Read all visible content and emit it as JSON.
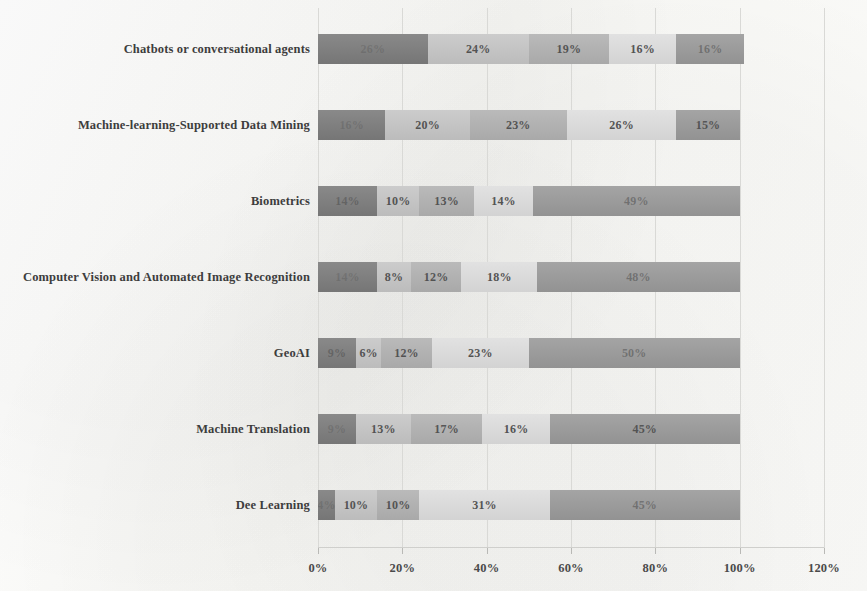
{
  "chart_data": {
    "type": "bar",
    "orientation": "horizontal",
    "stacked": true,
    "title": "",
    "xlabel": "",
    "ylabel": "",
    "xlim": [
      0,
      120
    ],
    "grid": true,
    "legend_position": "none",
    "xticks": [
      "0%",
      "20%",
      "40%",
      "60%",
      "80%",
      "100%",
      "120%"
    ],
    "xtick_values": [
      0,
      20,
      40,
      60,
      80,
      100,
      120
    ],
    "categories": [
      "Chatbots or conversational agents",
      "Machine-learning-Supported Data Mining",
      "Biometrics",
      "Computer Vision and Automated Image Recognition",
      "GeoAI",
      "Machine Translation",
      "Dee Learning"
    ],
    "series": [
      {
        "name": "Segment 1",
        "color": "#7c7c7c",
        "values": [
          26,
          16,
          14,
          14,
          9,
          9,
          4
        ]
      },
      {
        "name": "Segment 2",
        "color": "#c6c6c6",
        "values": [
          24,
          20,
          10,
          8,
          6,
          13,
          10
        ]
      },
      {
        "name": "Segment 3",
        "color": "#b2b2b2",
        "values": [
          19,
          23,
          13,
          12,
          12,
          17,
          10
        ]
      },
      {
        "name": "Segment 4",
        "color": "#dedede",
        "values": [
          16,
          26,
          14,
          18,
          23,
          16,
          31
        ]
      },
      {
        "name": "Segment 5",
        "color": "#9a9a9a",
        "values": [
          16,
          15,
          49,
          48,
          50,
          45,
          45
        ]
      }
    ],
    "bar_labels": [
      [
        "26%",
        "24%",
        "19%",
        "16%",
        "16%"
      ],
      [
        "16%",
        "20%",
        "23%",
        "26%",
        "15%"
      ],
      [
        "14%",
        "10%",
        "13%",
        "14%",
        "49%"
      ],
      [
        "14%",
        "8%",
        "12%",
        "18%",
        "48%"
      ],
      [
        "9%",
        "6%",
        "12%",
        "23%",
        "50%"
      ],
      [
        "9%",
        "13%",
        "17%",
        "16%",
        "45%"
      ],
      [
        "4%",
        "10%",
        "10%",
        "31%",
        "45%"
      ]
    ],
    "label_legibility": [
      [
        "faint",
        "clear",
        "clear",
        "clear",
        "semifaint"
      ],
      [
        "faint",
        "clear",
        "clear",
        "clear",
        "clear"
      ],
      [
        "semifaint",
        "clear",
        "clear",
        "clear",
        "semifaint"
      ],
      [
        "faint",
        "clear",
        "clear",
        "clear",
        "semifaint"
      ],
      [
        "semifaint",
        "clear",
        "clear",
        "clear",
        "semifaint"
      ],
      [
        "faint",
        "clear",
        "clear",
        "clear",
        "clear"
      ],
      [
        "faint",
        "clear",
        "clear",
        "clear",
        "semifaint"
      ]
    ]
  }
}
